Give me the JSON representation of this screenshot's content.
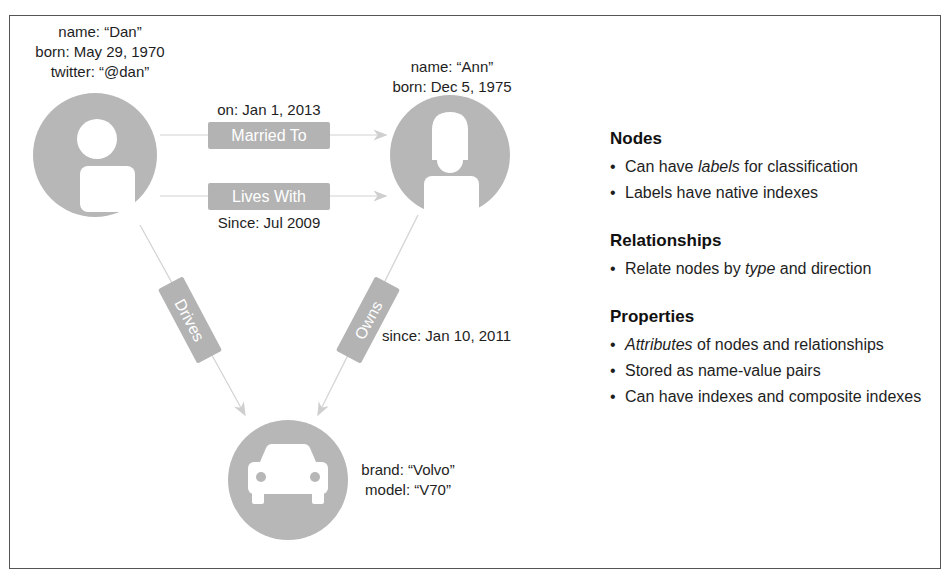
{
  "diagram": {
    "nodes": {
      "dan": {
        "icon": "person-male-icon",
        "properties": [
          "name: “Dan”",
          "born: May 29, 1970",
          "twitter: “@dan”"
        ]
      },
      "ann": {
        "icon": "person-female-icon",
        "properties": [
          "name: “Ann”",
          "born: Dec 5, 1975"
        ]
      },
      "car": {
        "icon": "car-icon",
        "properties": [
          "brand: “Volvo”",
          "model: “V70”"
        ]
      }
    },
    "relationships": {
      "married_to": {
        "type": "Married To",
        "property": "on: Jan 1, 2013",
        "from": "Dan",
        "to": "Ann"
      },
      "lives_with": {
        "type": "Lives With",
        "property": "Since: Jul 2009",
        "from": "Dan",
        "to": "Ann"
      },
      "drives": {
        "type": "Drives",
        "from": "Dan",
        "to": "Car"
      },
      "owns": {
        "type": "Owns",
        "property": "since: Jan 10, 2011",
        "from": "Ann",
        "to": "Car"
      }
    },
    "colors": {
      "node_fill": "#b7b7b7",
      "pill_fill": "#b3b3b3",
      "edge": "#cfcfcf",
      "frame": "#555555"
    }
  },
  "legend": {
    "nodes": {
      "title": "Nodes",
      "items": [
        {
          "pre": "Can have ",
          "em": "labels",
          "post": " for classification"
        },
        {
          "pre": "Labels have native indexes",
          "em": "",
          "post": ""
        }
      ]
    },
    "relationships": {
      "title": "Relationships",
      "items": [
        {
          "pre": "Relate nodes by ",
          "em": "type",
          "post": " and direction"
        }
      ]
    },
    "properties": {
      "title": "Properties",
      "items": [
        {
          "pre": "",
          "em": "Attributes",
          "post": " of nodes and relationships"
        },
        {
          "pre": "Stored as name-value pairs",
          "em": "",
          "post": ""
        },
        {
          "pre": "Can have indexes and composite indexes",
          "em": "",
          "post": ""
        }
      ]
    }
  }
}
